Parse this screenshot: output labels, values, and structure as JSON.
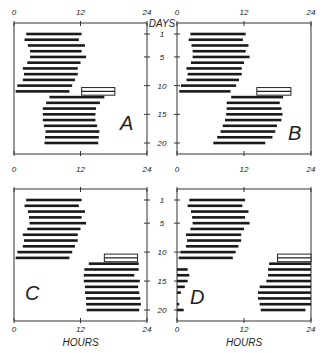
{
  "figure": {
    "type": "actogram-raster",
    "x_axis": {
      "label": "HOURS",
      "ticks": [
        "0",
        "12",
        "24"
      ],
      "range": [
        0,
        24
      ]
    },
    "y_axis": {
      "label": "DAYS",
      "ticks": [
        "1",
        "5",
        "10",
        "15",
        "20"
      ],
      "range": [
        1,
        20
      ]
    },
    "stimulus_color": "#ffffff",
    "bar_color": "#1a1a1a"
  },
  "panels": [
    {
      "id": "A",
      "label": "A",
      "stimulus": {
        "day": 11,
        "start": 12.2,
        "end": 18.2
      },
      "bars": [
        [
          [
            2.2,
            12.2
          ]
        ],
        [
          [
            1.9,
            11.7
          ]
        ],
        [
          [
            2.5,
            12.8
          ]
        ],
        [
          [
            2.9,
            12.2
          ]
        ],
        [
          [
            2.9,
            13.0
          ]
        ],
        [
          [
            2.4,
            12.0
          ]
        ],
        [
          [
            1.6,
            11.5
          ]
        ],
        [
          [
            1.8,
            11.5
          ]
        ],
        [
          [
            1.6,
            11.0
          ]
        ],
        [
          [
            0.6,
            10.5
          ]
        ],
        [
          [
            0.3,
            10.0
          ]
        ],
        [
          [
            6.4,
            16.3
          ]
        ],
        [
          [
            5.8,
            15.5
          ]
        ],
        [
          [
            5.2,
            14.8
          ]
        ],
        [
          [
            5.2,
            14.7
          ]
        ],
        [
          [
            5.2,
            14.7
          ]
        ],
        [
          [
            5.4,
            15.0
          ]
        ],
        [
          [
            5.7,
            15.4
          ]
        ],
        [
          [
            5.6,
            15.3
          ]
        ],
        [
          [
            5.5,
            15.2
          ]
        ]
      ]
    },
    {
      "id": "B",
      "label": "B",
      "stimulus": {
        "day": 11,
        "start": 14.3,
        "end": 20.4
      },
      "bars": [
        [
          [
            2.4,
            12.3
          ]
        ],
        [
          [
            2.1,
            11.8
          ]
        ],
        [
          [
            2.6,
            12.8
          ]
        ],
        [
          [
            2.8,
            12.3
          ]
        ],
        [
          [
            2.8,
            13.0
          ]
        ],
        [
          [
            2.5,
            12.0
          ]
        ],
        [
          [
            1.7,
            11.6
          ]
        ],
        [
          [
            1.9,
            11.6
          ]
        ],
        [
          [
            1.7,
            11.1
          ]
        ],
        [
          [
            0.7,
            10.6
          ]
        ],
        [
          [
            0.4,
            9.6
          ]
        ],
        [
          [
            9.7,
            19.0
          ]
        ],
        [
          [
            8.9,
            18.4
          ]
        ],
        [
          [
            8.9,
            18.7
          ]
        ],
        [
          [
            8.8,
            18.9
          ]
        ],
        [
          [
            8.6,
            18.7
          ]
        ],
        [
          [
            8.2,
            17.9
          ]
        ],
        [
          [
            7.8,
            17.6
          ]
        ],
        [
          [
            7.2,
            17.1
          ]
        ],
        [
          [
            6.5,
            15.8
          ]
        ]
      ]
    },
    {
      "id": "C",
      "label": "C",
      "stimulus": {
        "day": 11,
        "start": 16.3,
        "end": 22.3
      },
      "bars": [
        [
          [
            2.2,
            12.2
          ]
        ],
        [
          [
            1.9,
            11.7
          ]
        ],
        [
          [
            2.5,
            12.8
          ]
        ],
        [
          [
            2.7,
            12.2
          ]
        ],
        [
          [
            2.8,
            13.0
          ]
        ],
        [
          [
            2.4,
            12.0
          ]
        ],
        [
          [
            1.6,
            11.5
          ]
        ],
        [
          [
            1.8,
            11.5
          ]
        ],
        [
          [
            1.6,
            11.0
          ]
        ],
        [
          [
            0.6,
            10.5
          ]
        ],
        [
          [
            0.3,
            10.0
          ]
        ],
        [
          [
            13.5,
            22.5
          ]
        ],
        [
          [
            12.7,
            22.5
          ]
        ],
        [
          [
            12.6,
            21.7
          ]
        ],
        [
          [
            12.6,
            22.7
          ]
        ],
        [
          [
            12.8,
            22.4
          ]
        ],
        [
          [
            12.8,
            22.6
          ]
        ],
        [
          [
            13.0,
            22.8
          ]
        ],
        [
          [
            13.0,
            22.9
          ]
        ],
        [
          [
            13.1,
            22.6
          ]
        ]
      ]
    },
    {
      "id": "D",
      "label": "D",
      "stimulus": {
        "day": 11,
        "start": 18.0,
        "end": 24.0
      },
      "bars": [
        [
          [
            2.2,
            12.2
          ]
        ],
        [
          [
            1.9,
            11.7
          ]
        ],
        [
          [
            2.5,
            12.8
          ]
        ],
        [
          [
            2.7,
            12.2
          ]
        ],
        [
          [
            2.8,
            13.0
          ]
        ],
        [
          [
            2.4,
            12.0
          ]
        ],
        [
          [
            1.6,
            11.5
          ]
        ],
        [
          [
            1.8,
            11.5
          ]
        ],
        [
          [
            1.6,
            11.0
          ]
        ],
        [
          [
            0.6,
            10.5
          ]
        ],
        [
          [
            0.3,
            10.0
          ]
        ],
        [
          [
            16.5,
            24.0
          ]
        ],
        [
          [
            0,
            1.9
          ],
          [
            16.3,
            24.0
          ]
        ],
        [
          [
            0,
            2.2
          ],
          [
            16.3,
            24.0
          ]
        ],
        [
          [
            0,
            1.9
          ],
          [
            16.0,
            24.0
          ]
        ],
        [
          [
            0,
            1.4
          ],
          [
            14.8,
            24.0
          ]
        ],
        [
          [
            0,
            0.7
          ],
          [
            14.5,
            24.0
          ]
        ],
        [
          [
            14.5,
            24.0
          ]
        ],
        [
          [
            0,
            0.4
          ],
          [
            14.8,
            24.0
          ]
        ],
        [
          [
            0,
            1.2
          ],
          [
            15.0,
            23.0
          ]
        ]
      ]
    }
  ]
}
